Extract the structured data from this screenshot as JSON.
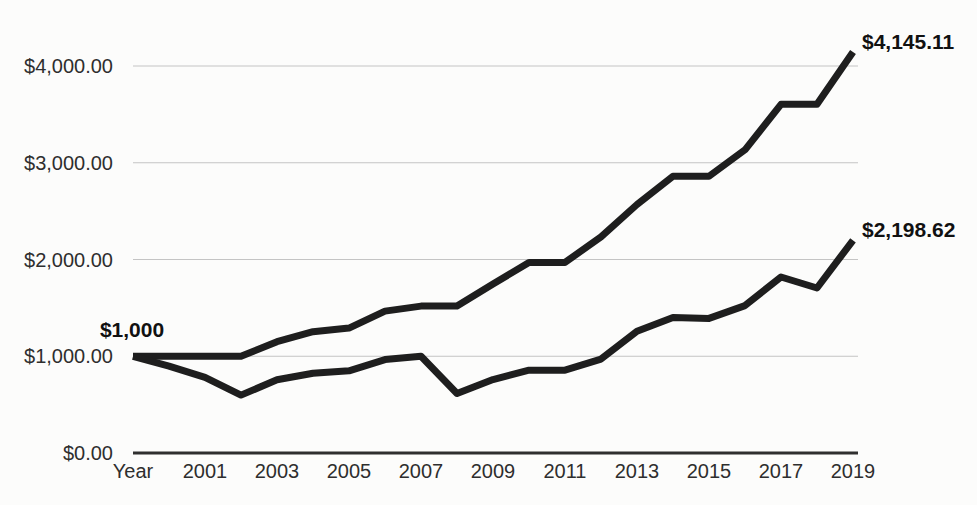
{
  "chart_data": {
    "type": "line",
    "title": "",
    "categories": [
      "Year",
      "2000",
      "2001",
      "2002",
      "2003",
      "2004",
      "2005",
      "2006",
      "2007",
      "2008",
      "2009",
      "2010",
      "2011",
      "2012",
      "2013",
      "2014",
      "2015",
      "2016",
      "2017",
      "2018",
      "2019"
    ],
    "series": [
      {
        "id": "upper-growth-line",
        "end_label": "$4,145.11",
        "end_value": 4145.11,
        "values": [
          1000,
          1000,
          1000,
          1000,
          1150.0,
          1253.39,
          1291.0,
          1466.83,
          1518.61,
          1518.61,
          1746.4,
          1969.59,
          1969.59,
          2233.71,
          2568.77,
          2861.35,
          2861.35,
          3134.32,
          3604.47,
          3604.47,
          4145.11
        ]
      },
      {
        "id": "lower-index-line",
        "end_label": "$2,198.62",
        "end_value": 2198.62,
        "values": [
          1000,
          898.6,
          781.42,
          598.8,
          756.76,
          824.79,
          849.53,
          965.24,
          999.31,
          614.68,
          758.82,
          855.8,
          855.77,
          970.53,
          1257.81,
          1401.08,
          1390.85,
          1523.54,
          1819.41,
          1705.88,
          2198.62
        ]
      }
    ],
    "annotations": {
      "start_label": "$1,000",
      "start_value": 1000
    },
    "y_axis": {
      "ticks": [
        {
          "value": 0,
          "label": "$0.00"
        },
        {
          "value": 1000,
          "label": "$1,000.00"
        },
        {
          "value": 2000,
          "label": "$2,000.00"
        },
        {
          "value": 3000,
          "label": "$3,000.00"
        },
        {
          "value": 4000,
          "label": "$4,000.00"
        }
      ]
    },
    "x_axis": {
      "shown_tick_indices": [
        0,
        2,
        4,
        6,
        8,
        10,
        12,
        14,
        16,
        18,
        20
      ],
      "labels_shown": [
        "Year",
        "2001",
        "2003",
        "2005",
        "2007",
        "2009",
        "2011",
        "2013",
        "2015",
        "2017",
        "2019"
      ]
    },
    "ylim": [
      0,
      4300
    ],
    "grid": "horizontal",
    "legend": "none",
    "colors": {
      "line": "#1e1e1e",
      "grid": "#c4c4c4",
      "axis": "#2f2f2f",
      "text": "#2e2e2e",
      "label": "#111111",
      "background": "#fcfcfb"
    }
  }
}
